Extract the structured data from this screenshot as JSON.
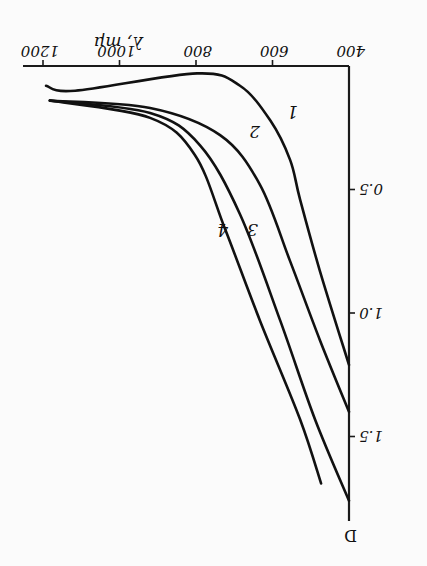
{
  "chart_data": {
    "type": "line",
    "title": "",
    "xlabel": "λ, mμ",
    "ylabel": "D",
    "xlim": [
      400,
      1200
    ],
    "ylim": [
      0,
      1.8
    ],
    "x_ticks": [
      "400",
      "600",
      "800",
      "1000",
      "1200"
    ],
    "y_ticks": [
      "0.5",
      "1.0",
      "1.5"
    ],
    "grid": false,
    "orientation_note": "image is rotated 180°",
    "series": [
      {
        "name": "1",
        "x": [
          1192,
          1116,
          797,
          685,
          606,
          554,
          528,
          476,
          400
        ],
        "y": [
          0.08,
          0.1,
          0.03,
          0.08,
          0.22,
          0.38,
          0.54,
          0.83,
          1.21
        ]
      },
      {
        "name": "2",
        "x": [
          1182,
          920,
          737,
          633,
          554,
          476,
          400
        ],
        "y": [
          0.14,
          0.17,
          0.28,
          0.48,
          0.79,
          1.11,
          1.4
        ]
      },
      {
        "name": "3",
        "x": [
          1182,
          920,
          790,
          685,
          580,
          489,
          400
        ],
        "y": [
          0.14,
          0.19,
          0.32,
          0.6,
          1.03,
          1.43,
          1.76
        ]
      },
      {
        "name": "4",
        "x": [
          1182,
          920,
          803,
          724,
          633,
          528,
          473
        ],
        "y": [
          0.14,
          0.21,
          0.36,
          0.66,
          1.03,
          1.43,
          1.69
        ]
      }
    ]
  },
  "labels": {
    "xlabel": "λ, mμ",
    "ylabel": "D",
    "xticks": [
      "400",
      "600",
      "800",
      "1000",
      "1200"
    ],
    "yticks": [
      "0.5",
      "1.0",
      "1.5"
    ],
    "curves": [
      "1",
      "2",
      "3",
      "4"
    ]
  }
}
